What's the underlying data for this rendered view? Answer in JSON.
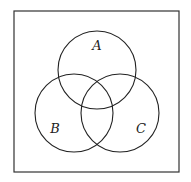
{
  "diagram": {
    "type": "venn",
    "universe": {
      "x": 14,
      "y": 11,
      "width": 165,
      "height": 161
    },
    "sets": [
      {
        "label": "A",
        "cx": 97,
        "cy": 70,
        "r": 39,
        "label_x": 97,
        "label_y": 50
      },
      {
        "label": "B",
        "cx": 74,
        "cy": 113,
        "r": 39,
        "label_x": 55,
        "label_y": 133
      },
      {
        "label": "C",
        "cx": 120,
        "cy": 113,
        "r": 39,
        "label_x": 141,
        "label_y": 133
      }
    ],
    "colors": {
      "stroke": "#222222",
      "background": "#ffffff"
    }
  }
}
